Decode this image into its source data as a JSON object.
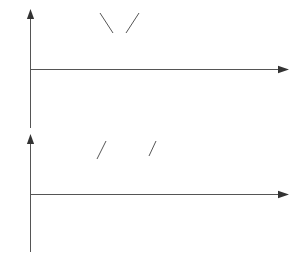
{
  "figure": {
    "ink_color": "#1f1f1f",
    "axis_color": "#555555",
    "dash_color": "#6e6e6e"
  },
  "top_panel": {
    "y_axis_label": "u",
    "x_axis_label": "ωt",
    "origin_label": "O",
    "series_labels": [
      {
        "id": "carrier",
        "label_html": "u<sub>c</sub>",
        "label_text": "uc"
      },
      {
        "id": "reference",
        "label_html": "u<sub>r</sub>",
        "label_text": "ur"
      }
    ]
  },
  "bottom_panel": {
    "y_axis_label_html": "u<sub>o</sub>",
    "y_axis_label_text": "uo",
    "x_axis_label": "ωt",
    "origin_label": "O",
    "level_labels": [
      {
        "id": "positive",
        "label_html": "U<sub>d</sub>",
        "label_text": "Ud",
        "value": 1
      },
      {
        "id": "negative",
        "label_html": "−U<sub>d</sub>",
        "label_text": "-Ud",
        "value": -1
      }
    ],
    "series_labels": [
      {
        "id": "output",
        "label_html": "u<sub>o</sub>",
        "label_text": "uo"
      },
      {
        "id": "fundamental",
        "label_html": "u<sub>o1</sub>",
        "label_text": "uo1"
      }
    ]
  },
  "chart_data": {
    "type": "line",
    "panels": [
      {
        "id": "top",
        "title": "",
        "xlabel": "ωt",
        "ylabel": "u",
        "xlim": [
          0,
          360
        ],
        "ylim": [
          -1.35,
          1.35
        ],
        "grid": false,
        "legend": [
          "ur",
          "uc"
        ],
        "legend_position": "inside-top",
        "series": [
          {
            "name": "uc",
            "role": "triangular-carrier",
            "waveform": "triangle",
            "amplitude": 1.0,
            "cycles": 15,
            "period_deg": 24,
            "phase_deg": 0
          },
          {
            "name": "ur",
            "role": "sinusoidal-reference",
            "waveform": "sine",
            "amplitude": 0.8,
            "cycles": 1,
            "period_deg": 360,
            "phase_deg": 0
          }
        ],
        "marker_lines_deg": [
          12,
          24,
          36,
          48
        ]
      },
      {
        "id": "bottom",
        "title": "",
        "xlabel": "ωt",
        "ylabel": "uo",
        "xlim": [
          0,
          360
        ],
        "ylim": [
          -1.35,
          1.35
        ],
        "grid": false,
        "legend": [
          "uo",
          "uo1"
        ],
        "legend_position": "inside-top",
        "yticks": [
          1,
          0,
          -1
        ],
        "yticklabels": [
          "Ud",
          "O",
          "-Ud"
        ],
        "series": [
          {
            "name": "uo",
            "role": "pwm-output",
            "waveform": "bipolar-square",
            "high": 1.0,
            "low": -1.0,
            "pulses": 15,
            "carrier_period_deg": 24,
            "duty_rule": "d = 0.5 + 0.4*sin(wt)",
            "duty_cycles": [
              0.56,
              0.69,
              0.8,
              0.88,
              0.9,
              0.88,
              0.8,
              0.69,
              0.56,
              0.42,
              0.3,
              0.21,
              0.13,
              0.11,
              0.14
            ]
          },
          {
            "name": "uo1",
            "role": "fundamental-component",
            "waveform": "sine",
            "amplitude": 0.8,
            "cycles": 1,
            "period_deg": 360,
            "phase_deg": 0,
            "style": "dashed"
          }
        ],
        "marker_lines_deg": [
          12,
          24,
          36,
          48
        ]
      }
    ]
  }
}
